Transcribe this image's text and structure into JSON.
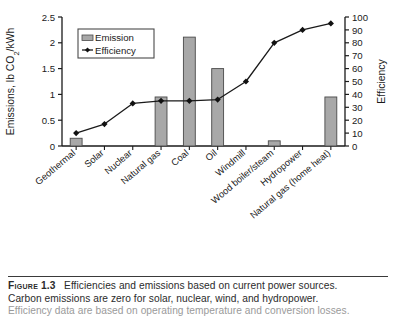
{
  "figure": {
    "label": "Figure",
    "number": "1.3",
    "caption_line1": "Efficiencies and emissions based on current power sources.",
    "caption_line2": "Carbon emissions are zero for solar, nuclear, wind, and hydropower.",
    "caption_line3": "Efficiency data are based on operating temperature and conversion losses."
  },
  "colors": {
    "bar_fill": "#a8a8a8",
    "bar_stroke": "#4a4a4a",
    "line": "#1a1a1a",
    "marker": "#111111",
    "axis": "#1a1a1a",
    "legend_border": "#4a4a4a",
    "background": "#ffffff"
  },
  "chart_data": {
    "type": "bar",
    "title": "",
    "xlabel": "",
    "ylabel": "Emissions, lb CO2/kWh",
    "ylabel_parts": {
      "pre": "Emissions, lb CO",
      "sub": "2",
      "post": "/kWh"
    },
    "y2label": "Efficiency",
    "ylim": [
      0,
      2.5
    ],
    "y2lim": [
      0,
      100
    ],
    "yticks": [
      "0",
      "0.5",
      "1",
      "1.5",
      "2",
      "2.5"
    ],
    "ytick_values": [
      0,
      0.5,
      1,
      1.5,
      2,
      2.5
    ],
    "y2ticks": [
      "0",
      "10",
      "20",
      "30",
      "40",
      "50",
      "60",
      "70",
      "80",
      "90",
      "100"
    ],
    "y2tick_values": [
      0,
      10,
      20,
      30,
      40,
      50,
      60,
      70,
      80,
      90,
      100
    ],
    "grid": false,
    "legend_position": "upper-left-inside",
    "categories": [
      "Geothermal",
      "Solar",
      "Nuclear",
      "Natural gas",
      "Coal",
      "Oil",
      "Windmill",
      "Wood boiler/steam",
      "Hydropower",
      "Natural gas (home heat)"
    ],
    "series": [
      {
        "name": "Emission",
        "type": "bar",
        "axis": "left",
        "units": "lb CO2/kWh",
        "values": [
          0.15,
          0,
          0,
          0.95,
          2.11,
          1.5,
          0,
          0.1,
          0,
          0.95
        ]
      },
      {
        "name": "Efficiency",
        "type": "line",
        "axis": "right",
        "units": "%",
        "values": [
          10,
          17,
          33,
          35,
          35,
          36,
          50,
          80,
          90,
          95
        ]
      }
    ]
  },
  "legend": {
    "entries": [
      {
        "label": "Emission",
        "marker": "bar-swatch"
      },
      {
        "label": "Efficiency",
        "marker": "line-diamond"
      }
    ]
  }
}
